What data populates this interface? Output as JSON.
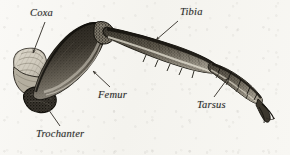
{
  "figure": {
    "style": "engraved line drawing / stipple halftone",
    "background_color": "#f7f6f2",
    "ink_color": "#2b2b2b"
  },
  "labels": [
    {
      "id": "coxa",
      "text": "Coxa",
      "x": 30,
      "y": 8,
      "arrow": {
        "from_x": 45,
        "from_y": 22,
        "to_x": 33,
        "to_y": 53
      }
    },
    {
      "id": "trochanter",
      "text": "Trochanter",
      "x": 36,
      "y": 129,
      "arrow": {
        "from_x": 60,
        "from_y": 126,
        "to_x": 46,
        "to_y": 106
      }
    },
    {
      "id": "femur",
      "text": "Femur",
      "x": 98,
      "y": 90,
      "arrow": {
        "from_x": 110,
        "from_y": 87,
        "to_x": 93,
        "to_y": 71
      }
    },
    {
      "id": "tibia",
      "text": "Tibia",
      "x": 180,
      "y": 7,
      "arrow": {
        "from_x": 178,
        "from_y": 21,
        "to_x": 156,
        "to_y": 40
      }
    },
    {
      "id": "tarsus",
      "text": "Tarsus",
      "x": 197,
      "y": 100,
      "arrow": {
        "from_x": 214,
        "from_y": 97,
        "to_x": 228,
        "to_y": 78
      }
    }
  ],
  "segments": [
    {
      "id": "coxa",
      "name": "Coxa",
      "tone": "light",
      "description": "rounded pale basal segment with fine concentric hatching"
    },
    {
      "id": "trochanter",
      "name": "Trochanter",
      "tone": "dark",
      "description": "short dark wedge joining coxa to femur"
    },
    {
      "id": "femur",
      "name": "Femur",
      "tone": "dark",
      "description": "thick elongated oval, heavily stippled, curving up-right"
    },
    {
      "id": "tibia",
      "name": "Tibia",
      "tone": "medium-dark",
      "description": "long slender tapering shaft angled down-right"
    },
    {
      "id": "tarsus",
      "name": "Tarsus",
      "tone": "medium",
      "description": "segmented chain of small joints ending in a curved claw"
    }
  ]
}
